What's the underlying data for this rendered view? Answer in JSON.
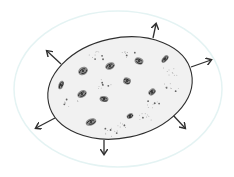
{
  "diagram": {
    "colors": {
      "background": "#ffffff",
      "outer_halo": "#e4f3f3",
      "oval_fill": "#f1f1f1",
      "ink": "#2f2f2f",
      "dots": "#555555"
    },
    "outer_halo": {
      "cx": 118,
      "cy": 89,
      "rx": 104,
      "ry": 78
    },
    "oval": {
      "cx": 120,
      "cy": 88,
      "rx": 73,
      "ry": 50,
      "rotate": -12
    },
    "arrows": [
      {
        "name": "arrow-top",
        "x1": 153,
        "y1": 38,
        "x2": 156,
        "y2": 24
      },
      {
        "name": "arrow-upper-right",
        "x1": 191,
        "y1": 67,
        "x2": 211,
        "y2": 60
      },
      {
        "name": "arrow-lower-right",
        "x1": 172,
        "y1": 114,
        "x2": 185,
        "y2": 128
      },
      {
        "name": "arrow-bottom",
        "x1": 104,
        "y1": 140,
        "x2": 104,
        "y2": 154
      },
      {
        "name": "arrow-lower-left",
        "x1": 55,
        "y1": 118,
        "x2": 36,
        "y2": 128
      },
      {
        "name": "arrow-upper-left",
        "x1": 61,
        "y1": 64,
        "x2": 47,
        "y2": 51
      }
    ],
    "galaxies": [
      {
        "x": 83,
        "y": 71,
        "rx": 5,
        "ry": 4,
        "rot": -30
      },
      {
        "x": 110,
        "y": 66,
        "rx": 5,
        "ry": 3.5,
        "rot": -25
      },
      {
        "x": 139,
        "y": 61,
        "rx": 4.5,
        "ry": 3.5,
        "rot": 20
      },
      {
        "x": 165,
        "y": 59,
        "rx": 4.5,
        "ry": 2.5,
        "rot": -50
      },
      {
        "x": 61,
        "y": 85,
        "rx": 4.5,
        "ry": 2.5,
        "rot": -70
      },
      {
        "x": 127,
        "y": 81,
        "rx": 4,
        "ry": 3.5,
        "rot": 20
      },
      {
        "x": 82,
        "y": 94,
        "rx": 5,
        "ry": 3.5,
        "rot": -30
      },
      {
        "x": 104,
        "y": 99,
        "rx": 4.5,
        "ry": 3,
        "rot": 10
      },
      {
        "x": 152,
        "y": 92,
        "rx": 4,
        "ry": 3,
        "rot": -40
      },
      {
        "x": 91,
        "y": 122,
        "rx": 5.5,
        "ry": 3.5,
        "rot": -20
      },
      {
        "x": 130,
        "y": 116,
        "rx": 3.5,
        "ry": 2.5,
        "rot": -30
      }
    ],
    "dot_clusters": [
      {
        "x": 96,
        "y": 55
      },
      {
        "x": 128,
        "y": 55
      },
      {
        "x": 170,
        "y": 72
      },
      {
        "x": 105,
        "y": 84
      },
      {
        "x": 72,
        "y": 104
      },
      {
        "x": 155,
        "y": 104
      },
      {
        "x": 118,
        "y": 124
      },
      {
        "x": 145,
        "y": 118
      },
      {
        "x": 172,
        "y": 88
      },
      {
        "x": 110,
        "y": 132
      }
    ]
  }
}
